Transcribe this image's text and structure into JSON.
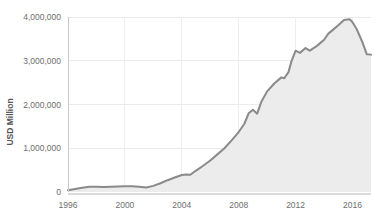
{
  "chart_data": {
    "type": "area",
    "title": "",
    "subtitle": "",
    "xlabel": "",
    "ylabel": "USD Million",
    "xlim": [
      1996,
      2017.3
    ],
    "ylim": [
      0,
      4200000
    ],
    "grid": true,
    "legend": false,
    "legend_position": "none",
    "y_ticks": [
      0,
      1000000,
      2000000,
      3000000,
      4000000
    ],
    "y_tick_labels": [
      "0",
      "1,000,000",
      "2,000,000",
      "3,000,000",
      "4,000,000"
    ],
    "x_ticks": [
      1996,
      2000,
      2004,
      2008,
      2012,
      2016
    ],
    "x_tick_labels": [
      "1996",
      "2000",
      "2004",
      "2008",
      "2012",
      "2016"
    ],
    "series": [
      {
        "name": "USD Million",
        "line_color": "#8a8a8a",
        "fill_color": "#ececec",
        "x": [
          1996.0,
          1996.5,
          1997.0,
          1997.5,
          1998.0,
          1998.5,
          1999.0,
          1999.5,
          2000.0,
          2000.5,
          2001.0,
          2001.5,
          2002.0,
          2002.5,
          2003.0,
          2003.5,
          2004.0,
          2004.3,
          2004.6,
          2005.0,
          2005.5,
          2006.0,
          2006.5,
          2007.0,
          2007.5,
          2008.0,
          2008.4,
          2008.7,
          2009.0,
          2009.3,
          2009.6,
          2010.0,
          2010.5,
          2011.0,
          2011.2,
          2011.5,
          2011.7,
          2012.0,
          2012.3,
          2012.7,
          2013.0,
          2013.5,
          2014.0,
          2014.3,
          2014.6,
          2015.0,
          2015.4,
          2015.8,
          2016.0,
          2016.3,
          2016.7,
          2017.0,
          2017.3
        ],
        "y": [
          40000,
          70000,
          95000,
          120000,
          120000,
          115000,
          120000,
          125000,
          130000,
          130000,
          120000,
          105000,
          140000,
          200000,
          270000,
          330000,
          390000,
          400000,
          395000,
          490000,
          600000,
          720000,
          860000,
          1000000,
          1180000,
          1370000,
          1560000,
          1800000,
          1880000,
          1790000,
          2070000,
          2300000,
          2480000,
          2620000,
          2600000,
          2740000,
          2980000,
          3230000,
          3180000,
          3290000,
          3230000,
          3340000,
          3480000,
          3620000,
          3700000,
          3810000,
          3930000,
          3950000,
          3880000,
          3720000,
          3420000,
          3150000,
          3140000
        ],
        "peak_value": 3950000,
        "peak_year": 2015.4,
        "start_value": 40000,
        "end_value": 3050000
      }
    ]
  },
  "caption": ""
}
